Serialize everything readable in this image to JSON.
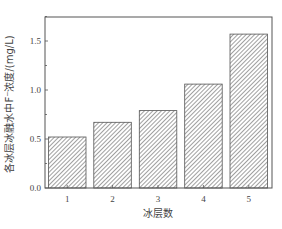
{
  "chart_data": {
    "type": "bar",
    "title": "",
    "categories": [
      "1",
      "2",
      "3",
      "4",
      "5"
    ],
    "values": [
      0.52,
      0.67,
      0.79,
      1.06,
      1.57
    ],
    "xlabel": "冰层数",
    "ylabel": "各冰层冰融水中F⁻浓度/(mg/L)",
    "ylim": [
      0.0,
      1.75
    ],
    "yticks": [
      "0.0",
      "0.5",
      "1.0",
      "1.5"
    ],
    "ytick_values": [
      0.0,
      0.5,
      1.0,
      1.5
    ],
    "grid": false,
    "legend": null,
    "bar_style": "diagonal hatch",
    "colors": {
      "frame": "#555555",
      "hatch": "#777777",
      "bar_edge": "#555555",
      "background": "#ffffff"
    }
  }
}
